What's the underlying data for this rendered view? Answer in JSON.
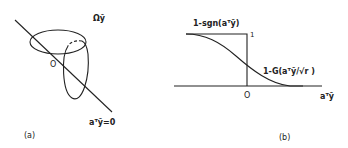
{
  "panel_a": {
    "caption": "(a)",
    "region_label": "Ωỹ",
    "origin_label": "O",
    "hyperplane_label": "aᵀỹ=0"
  },
  "panel_b": {
    "caption": "(b)",
    "step_label": "1-sgn(aᵀỹ)",
    "step_top_value": "1",
    "smooth_label": "1-G(aᵀỹ/√r )",
    "origin_label": "O",
    "x_axis_label": "aᵀỹ"
  },
  "colors": {
    "ink": "#222222",
    "background": "#ffffff"
  }
}
